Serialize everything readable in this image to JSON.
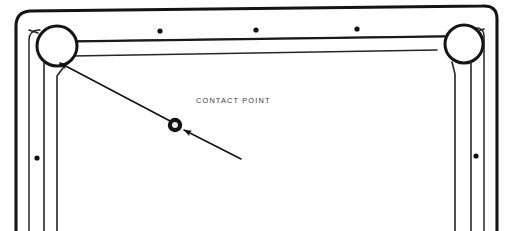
{
  "diagram": {
    "background_color": "#ffffff",
    "line_color": "#1a1a1a",
    "thin_line_color": "#2b2b2b",
    "text_color": "#3b3b3b",
    "width": 512,
    "height": 231,
    "annotations": [
      {
        "id": "contact-point",
        "label": "CONTACT POINT",
        "x": 196,
        "y": 103
      }
    ],
    "markers": {
      "contact_point_marker": {
        "cx": 175,
        "cy": 125,
        "outer_radius": 7.2,
        "inner_radius": 3.0,
        "fill": "#111111",
        "inner_fill": "#e8e8e8"
      },
      "rail_dots": [
        {
          "cx": 160,
          "cy": 31,
          "r": 2.6
        },
        {
          "cx": 256,
          "cy": 30,
          "r": 2.6
        },
        {
          "cx": 357,
          "cy": 29,
          "r": 2.6
        }
      ],
      "post_dots": [
        {
          "cx": 37,
          "cy": 158,
          "r": 2.6
        },
        {
          "cx": 476,
          "cy": 156,
          "r": 2.6
        }
      ]
    },
    "leaders": [
      {
        "id": "leader-to-corner-circle",
        "from_x": 172,
        "from_y": 122,
        "to_x": 56,
        "to_y": 62,
        "arrow_at": "to"
      },
      {
        "id": "leader-from-lower-right",
        "from_x": 241,
        "from_y": 159,
        "to_x": 181,
        "to_y": 129,
        "arrow_at": "to"
      }
    ],
    "corner_circles": [
      {
        "id": "left-corner-circle",
        "cx": 57,
        "cy": 46,
        "r": 20
      },
      {
        "id": "right-corner-circle",
        "cx": 464,
        "cy": 44,
        "r": 19
      }
    ]
  }
}
